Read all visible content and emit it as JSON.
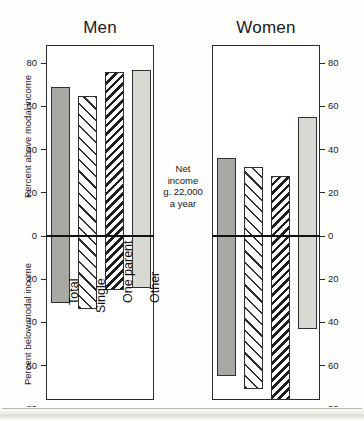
{
  "figure": {
    "panels": [
      {
        "title": "Men"
      },
      {
        "title": "Women"
      }
    ],
    "axis_title_above": "Percent above modal income",
    "axis_title_below": "Percent below modal income",
    "center_note": "Net\nincome\ng. 22,000\na year",
    "tick_labels": [
      "80",
      "60",
      "40",
      "20",
      "0",
      "20",
      "40",
      "60",
      "80"
    ],
    "category_labels": [
      "Total",
      "Single",
      "One parent",
      "Other"
    ],
    "colors": {
      "solid_dark": "#a8a8a4",
      "solid_light": "#d9d9d4",
      "hatch": "#2f2f2f",
      "axis": "#2b2b2b",
      "background": "#ffffff"
    }
  },
  "chart_data": {
    "type": "bar",
    "subtitle": "Net income g. 22,000 a year",
    "xlabel": "",
    "ylabel": "Percent above modal income / Percent below modal income",
    "ylim": [
      -80,
      80
    ],
    "yticks": [
      -80,
      -60,
      -40,
      -20,
      0,
      20,
      40,
      60,
      80
    ],
    "ytick_labels": [
      "80",
      "60",
      "40",
      "20",
      "0",
      "20",
      "40",
      "60",
      "80"
    ],
    "grid": false,
    "legend": "none",
    "orientation": "vertical-diverging",
    "note": "Positive values are plotted upward as 'Percent above modal income'; negative values are plotted downward and labelled with positive magnitudes as 'Percent below modal income'.",
    "categories": [
      "Total",
      "Single",
      "One parent",
      "Other"
    ],
    "panels": [
      {
        "name": "Men",
        "above": [
          69,
          65,
          76,
          77
        ],
        "below": [
          31,
          34,
          25,
          24
        ]
      },
      {
        "name": "Women",
        "above": [
          36,
          32,
          28,
          55
        ],
        "below": [
          65,
          71,
          76,
          43
        ]
      }
    ],
    "series": [
      {
        "name": "Men - above modal income",
        "categories": [
          "Total",
          "Single",
          "One parent",
          "Other"
        ],
        "values": [
          69,
          65,
          76,
          77
        ]
      },
      {
        "name": "Men - below modal income",
        "categories": [
          "Total",
          "Single",
          "One parent",
          "Other"
        ],
        "values": [
          -31,
          -34,
          -25,
          -24
        ]
      },
      {
        "name": "Women - above modal income",
        "categories": [
          "Total",
          "Single",
          "One parent",
          "Other"
        ],
        "values": [
          36,
          32,
          28,
          55
        ]
      },
      {
        "name": "Women - below modal income",
        "categories": [
          "Total",
          "Single",
          "One parent",
          "Other"
        ],
        "values": [
          -65,
          -71,
          -76,
          -43
        ]
      }
    ],
    "bar_styles": [
      "solid-dark-gray",
      "white-diagonal-hatch",
      "dense-dark-diagonal-hatch",
      "solid-light-gray"
    ]
  }
}
